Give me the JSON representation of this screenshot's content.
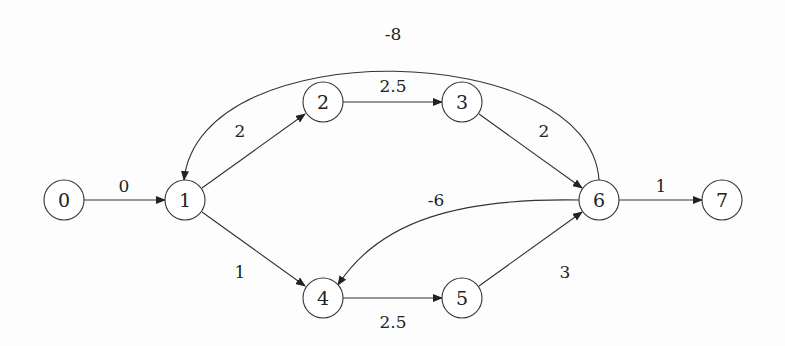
{
  "graph": {
    "type": "directed-weighted",
    "nodes": [
      {
        "id": "0",
        "label": "0",
        "x": 64,
        "y": 200
      },
      {
        "id": "1",
        "label": "1",
        "x": 185,
        "y": 200
      },
      {
        "id": "2",
        "label": "2",
        "x": 323,
        "y": 102
      },
      {
        "id": "3",
        "label": "3",
        "x": 462,
        "y": 102
      },
      {
        "id": "4",
        "label": "4",
        "x": 323,
        "y": 298
      },
      {
        "id": "5",
        "label": "5",
        "x": 462,
        "y": 298
      },
      {
        "id": "6",
        "label": "6",
        "x": 599,
        "y": 200
      },
      {
        "id": "7",
        "label": "7",
        "x": 722,
        "y": 200
      }
    ],
    "edges": [
      {
        "from": "0",
        "to": "1",
        "weight": "0"
      },
      {
        "from": "1",
        "to": "2",
        "weight": "2"
      },
      {
        "from": "2",
        "to": "3",
        "weight": "2.5"
      },
      {
        "from": "3",
        "to": "6",
        "weight": "2"
      },
      {
        "from": "1",
        "to": "4",
        "weight": "1"
      },
      {
        "from": "4",
        "to": "5",
        "weight": "2.5"
      },
      {
        "from": "5",
        "to": "6",
        "weight": "3"
      },
      {
        "from": "6",
        "to": "7",
        "weight": "1"
      },
      {
        "from": "6",
        "to": "1",
        "weight": "-8"
      },
      {
        "from": "6",
        "to": "4",
        "weight": "-6"
      }
    ]
  }
}
